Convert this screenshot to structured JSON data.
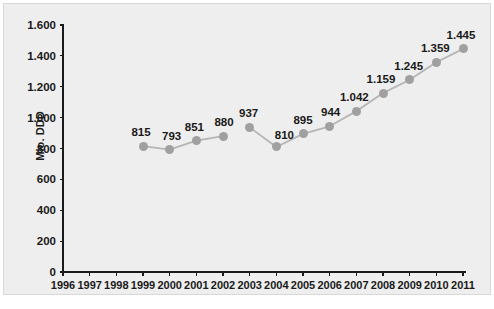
{
  "chart_data": {
    "type": "line",
    "title": "",
    "subtitle": "",
    "xlabel": "",
    "ylabel": "Mio. DDD",
    "xlim": [
      1996,
      2011
    ],
    "ylim": [
      0,
      1600
    ],
    "grid": false,
    "legend": null,
    "y_ticks": [
      "0",
      "200",
      "400",
      "600",
      "800",
      "1.000",
      "1.200",
      "1.400",
      "1.600"
    ],
    "y_tick_values": [
      0,
      200,
      400,
      600,
      800,
      1000,
      1200,
      1400,
      1600
    ],
    "x_ticks": [
      "1996",
      "1997",
      "1998",
      "1999",
      "2000",
      "2001",
      "2002",
      "2003",
      "2004",
      "2005",
      "2006",
      "2007",
      "2008",
      "2009",
      "2010",
      "2011"
    ],
    "categories": [
      1996,
      1997,
      1998,
      1999,
      2000,
      2001,
      2002,
      2003,
      2004,
      2005,
      2006,
      2007,
      2008,
      2009,
      2010,
      2011
    ],
    "values": [
      null,
      null,
      null,
      815,
      793,
      851,
      880,
      937,
      810,
      895,
      944,
      1042,
      1159,
      1245,
      1359,
      1445
    ],
    "point_labels": [
      null,
      null,
      null,
      "815",
      "793",
      "851",
      "880",
      "937",
      "810",
      "895",
      "944",
      "1.042",
      "1.159",
      "1.245",
      "1.359",
      "1.445"
    ],
    "series": [
      {
        "name": "Mio. DDD",
        "segments": [
          {
            "x": [
              1999,
              2000,
              2001,
              2002
            ],
            "values": [
              815,
              793,
              851,
              880
            ]
          },
          {
            "x": [
              2003,
              2004,
              2005,
              2006,
              2007,
              2008,
              2009,
              2010,
              2011
            ],
            "values": [
              937,
              810,
              895,
              944,
              1042,
              1159,
              1245,
              1359,
              1445
            ]
          }
        ]
      }
    ],
    "annotations": [],
    "colors": {
      "background": "#eeeeee",
      "page_background": "#ffffff",
      "panel_border": "#d8d8d8",
      "axis": "#1a1a1a",
      "line": "#b5b5b5",
      "marker": "#a0a0a0",
      "text": "#1a1a1a"
    }
  }
}
